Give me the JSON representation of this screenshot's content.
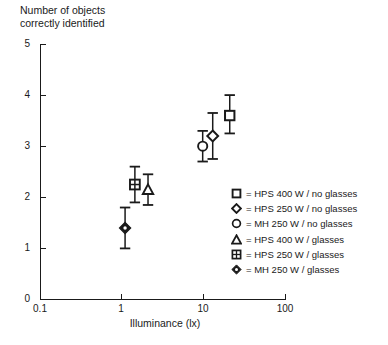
{
  "chart_data": {
    "type": "scatter",
    "title": "",
    "ylabel": "Number of objects\ncorrectly identified",
    "xlabel": "Illuminance (lx)",
    "xscale": "log",
    "yscale": "linear",
    "xlim": [
      0.1,
      100
    ],
    "ylim": [
      0,
      5
    ],
    "xticks": [
      "0.1",
      "1",
      "10",
      "100"
    ],
    "xtick_values": [
      0.1,
      1,
      10,
      100
    ],
    "yticks": [
      "0",
      "1",
      "2",
      "3",
      "4",
      "5"
    ],
    "ytick_values": [
      0,
      1,
      2,
      3,
      4,
      5
    ],
    "grid": false,
    "legend_position": "right",
    "error_bars": "vertical",
    "series": [
      {
        "name": "HPS 400 W / no glasses",
        "marker": "open-square",
        "x": [
          21.0
        ],
        "y": [
          3.6
        ],
        "yerr_low": [
          0.35
        ],
        "yerr_high": [
          0.4
        ]
      },
      {
        "name": "HPS 250 W / no glasses",
        "marker": "open-diamond",
        "x": [
          13.0
        ],
        "y": [
          3.2
        ],
        "yerr_low": [
          0.45
        ],
        "yerr_high": [
          0.45
        ]
      },
      {
        "name": "MH 250 W / no glasses",
        "marker": "open-circle",
        "x": [
          9.8
        ],
        "y": [
          3.0
        ],
        "yerr_low": [
          0.3
        ],
        "yerr_high": [
          0.3
        ]
      },
      {
        "name": "HPS 400 W / glasses",
        "marker": "open-triangle",
        "x": [
          2.1
        ],
        "y": [
          2.15
        ],
        "yerr_low": [
          0.3
        ],
        "yerr_high": [
          0.3
        ]
      },
      {
        "name": "HPS 250 W / glasses",
        "marker": "crossed-square",
        "x": [
          1.45
        ],
        "y": [
          2.25
        ],
        "yerr_low": [
          0.35
        ],
        "yerr_high": [
          0.35
        ]
      },
      {
        "name": "MH 250 W / glasses",
        "marker": "filled-diamond",
        "x": [
          1.1
        ],
        "y": [
          1.4
        ],
        "yerr_low": [
          0.4
        ],
        "yerr_high": [
          0.4
        ]
      }
    ]
  },
  "axes": {
    "y_title": "Number of objects\ncorrectly identified",
    "x_title": "Illuminance (lx)",
    "y_tick_labels": [
      "5",
      "4",
      "3",
      "2",
      "1",
      "0"
    ],
    "x_tick_labels": [
      "0.1",
      "1",
      "10",
      "100"
    ]
  },
  "legend": {
    "items": [
      {
        "marker": "open-square",
        "equals": "=",
        "label": "HPS 400 W / no glasses"
      },
      {
        "marker": "open-diamond",
        "equals": "=",
        "label": "HPS 250 W / no glasses"
      },
      {
        "marker": "open-circle",
        "equals": "=",
        "label": "MH 250 W / no glasses"
      },
      {
        "marker": "open-triangle",
        "equals": "=",
        "label": "HPS 400 W / glasses"
      },
      {
        "marker": "crossed-square",
        "equals": "=",
        "label": "HPS 250 W / glasses"
      },
      {
        "marker": "filled-diamond",
        "equals": "=",
        "label": "MH 250 W / glasses"
      }
    ]
  },
  "colors": {
    "ink": "#1a1a1a",
    "background": "#ffffff"
  }
}
